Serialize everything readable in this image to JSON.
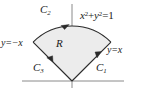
{
  "figure": {
    "colors": {
      "region_fill": "#ececec",
      "curve_stroke": "#2b2b2b",
      "axis_stroke": "#8a8a8a",
      "text": "#1a1a1a"
    },
    "labels": {
      "curve1": "C",
      "curve1_sub": "1",
      "curve2": "C",
      "curve2_sub": "2",
      "curve3": "C",
      "curve3_sub": "3",
      "region": "R",
      "circle_lhs_x": "x",
      "circle_exp_x": "2",
      "circle_plus": "+",
      "circle_lhs_y": "y",
      "circle_exp_y": "2",
      "circle_eq": "=",
      "circle_rhs": "1",
      "line_negative": "y=−x",
      "line_positive": "y=x"
    },
    "geometry": {
      "origin_x": 72,
      "origin_y": 81,
      "radius": 55,
      "start_angle_deg": 45,
      "end_angle_deg": 135,
      "x_axis_from": 22,
      "x_axis_to": 124,
      "y_axis_top": 4,
      "y_axis_bottom": 88,
      "arc_left_endpoint": [
        33,
        42
      ],
      "arc_right_endpoint": [
        111,
        42
      ],
      "arc_arrow_direction": "counterclockwise",
      "c1_arrow_direction": "outward-up-right",
      "c3_arrow_direction": "inward-down-right"
    }
  }
}
